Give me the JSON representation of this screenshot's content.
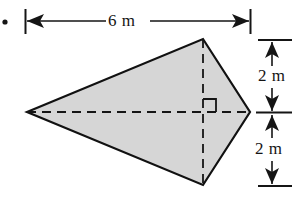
{
  "figure": {
    "bullet": {
      "name": "bullet-marker",
      "glyph": "•",
      "x": 5,
      "y": 22
    },
    "shape": {
      "type": "kite",
      "fill_color": "#d6d6d6",
      "stroke_color": "#111111",
      "stroke_width": 2.2,
      "vertices": [
        {
          "name": "left-vertex",
          "x": 27,
          "y": 112
        },
        {
          "name": "top-vertex",
          "x": 203,
          "y": 39
        },
        {
          "name": "right-vertex",
          "x": 250,
          "y": 112
        },
        {
          "name": "bottom-vertex",
          "x": 203,
          "y": 185
        }
      ]
    },
    "diagonals": [
      {
        "name": "horizontal-diagonal",
        "style": "dashed",
        "x1": 27,
        "y1": 112,
        "x2": 250,
        "y2": 112
      },
      {
        "name": "vertical-diagonal",
        "style": "dashed",
        "x1": 203,
        "y1": 39,
        "x2": 203,
        "y2": 185
      }
    ],
    "right_angle_marker": {
      "name": "right-angle-marker",
      "corner_x": 203,
      "corner_y": 112,
      "size": 13,
      "direction": "up-right"
    },
    "dimensions": [
      {
        "name": "width-dimension",
        "label": "6 m",
        "value": 6,
        "unit": "m",
        "orientation": "horizontal",
        "from_x": 25,
        "to_x": 250,
        "line_y": 21,
        "extension_top": 9,
        "extension_bottom": 34
      },
      {
        "name": "upper-height-dimension",
        "label": "2 m",
        "value": 2,
        "unit": "m",
        "orientation": "vertical",
        "from_y": 40,
        "to_y": 112,
        "line_x": 272,
        "extension_left": 258,
        "extension_right": 292
      },
      {
        "name": "lower-height-dimension",
        "label": "2 m",
        "value": 2,
        "unit": "m",
        "orientation": "vertical",
        "from_y": 113,
        "to_y": 186,
        "line_x": 272,
        "extension_left": 258,
        "extension_right": 292
      }
    ],
    "labels": {
      "width": "6 m",
      "upper_height": "2 m",
      "lower_height": "2 m"
    }
  }
}
